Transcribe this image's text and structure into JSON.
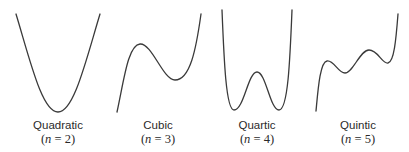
{
  "figure": {
    "panels": [
      {
        "id": "quadratic",
        "name": "Quadratic",
        "degree_label": "(n = 2)",
        "degree_open": "(",
        "degree_var": "n",
        "degree_rest": " = 2)",
        "degree": 2,
        "curve_path": "M16,14 C30,60 42,112 58,112 C74,112 86,60 100,14"
      },
      {
        "id": "cubic",
        "name": "Cubic",
        "degree_label": "(n = 3)",
        "degree_open": "(",
        "degree_var": "n",
        "degree_rest": " = 3)",
        "degree": 3,
        "curve_path": "M117,112 C124,80 128,45 140,44 C152,43 163,80 175,80 C190,80 196,50 201,14"
      },
      {
        "id": "quartic",
        "name": "Quartic",
        "degree_label": "(n = 4)",
        "degree_open": "(",
        "degree_var": "n",
        "degree_rest": " = 4)",
        "degree": 4,
        "curve_path": "M222,10 C224,60 226,110 234,110 C244,110 248,72 257,72 C266,72 270,110 279,110 C288,110 290,60 292,10"
      },
      {
        "id": "quintic",
        "name": "Quintic",
        "degree_label": "(n = 5)",
        "degree_open": "(",
        "degree_var": "n",
        "degree_rest": " = 5)",
        "degree": 5,
        "curve_path": "M316,111 C318,90 320,62 327,61 C334,60 338,73 345,73 C353,73 360,50 369,50 C378,50 382,64 388,63 C394,62 396,40 398,14"
      }
    ],
    "colors": {
      "stroke": "#3a3a3a",
      "text": "#2a2a2a",
      "background": "#ffffff"
    }
  }
}
